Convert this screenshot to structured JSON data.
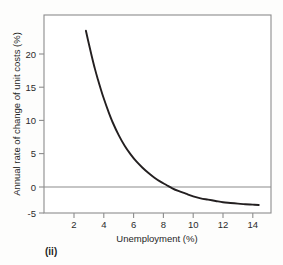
{
  "figure": {
    "caption": "(ii)",
    "background_color": "#fdfdfc",
    "frame_color": "#8c8c8c",
    "curve_color": "#231f20",
    "zero_line_color": "#8c8c8c",
    "tick_color": "#8c8c8c",
    "text_color": "#1f1f1f"
  },
  "chart_data": {
    "type": "line",
    "title": "",
    "subtitle": "",
    "xlabel": "Unemployment (%)",
    "ylabel": "Annual rate of change of unit costs (%)",
    "xlim": [
      1.2,
      15.4
    ],
    "ylim": [
      -5,
      25.6
    ],
    "xticks": [
      2,
      4,
      6,
      8,
      10,
      12,
      14
    ],
    "xtick_labels": [
      "2",
      "4",
      "6",
      "8",
      "10",
      "12",
      "14"
    ],
    "yticks": [
      -5,
      0,
      5,
      10,
      15,
      20
    ],
    "ytick_labels": [
      "-5",
      "0",
      "5",
      "10",
      "15",
      "20"
    ],
    "grid": false,
    "legend": null,
    "legend_position": "none",
    "annotations": [
      {
        "text": "zero reference line",
        "y": 0
      }
    ],
    "series": [
      {
        "name": "Annual rate of change of unit costs",
        "x": [
          2.8,
          3.0,
          3.2,
          3.4,
          3.6,
          3.8,
          4.0,
          4.3,
          4.6,
          5.0,
          5.4,
          5.8,
          6.2,
          6.6,
          7.0,
          7.4,
          7.8,
          8.2,
          8.6,
          9.0,
          9.5,
          10.0,
          10.5,
          11.0,
          11.5,
          12.0,
          12.5,
          13.0,
          13.5,
          14.0,
          14.4
        ],
        "values": [
          23.5,
          21.5,
          19.6,
          17.8,
          16.2,
          14.7,
          13.3,
          11.4,
          9.7,
          7.8,
          6.2,
          4.9,
          3.8,
          2.9,
          2.1,
          1.4,
          0.8,
          0.3,
          -0.2,
          -0.6,
          -1.0,
          -1.4,
          -1.7,
          -1.9,
          -2.1,
          -2.3,
          -2.4,
          -2.5,
          -2.6,
          -2.65,
          -2.7
        ]
      }
    ]
  }
}
